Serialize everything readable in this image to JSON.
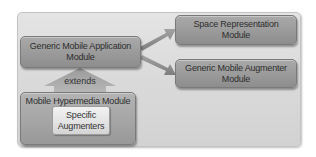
{
  "diagram": {
    "main_module": {
      "line1": "Generic Mobile Application",
      "line2": "Module"
    },
    "space_module": {
      "line1": "Space Representation",
      "line2": "Module"
    },
    "augmenter_module": {
      "line1": "Generic Mobile Augmenter",
      "line2": "Module"
    },
    "hypermedia_module": {
      "label": "Mobile Hypermedia Module",
      "inner": {
        "line1": "Specific",
        "line2": "Augmenters"
      }
    },
    "extends_label": "extends",
    "edges": [
      {
        "from": "Generic Mobile Application Module",
        "to": "Space Representation Module",
        "type": "arrow"
      },
      {
        "from": "Generic Mobile Application Module",
        "to": "Generic Mobile Augmenter Module",
        "type": "arrow"
      },
      {
        "from": "Mobile Hypermedia Module",
        "to": "Generic Mobile Application Module",
        "type": "extends"
      }
    ],
    "colors": {
      "box_fill": "#9a9a9a",
      "container_fill": "#dadada",
      "inner_fill": "#e2e2e2",
      "arrow_fill": "#8e8e8e"
    }
  }
}
